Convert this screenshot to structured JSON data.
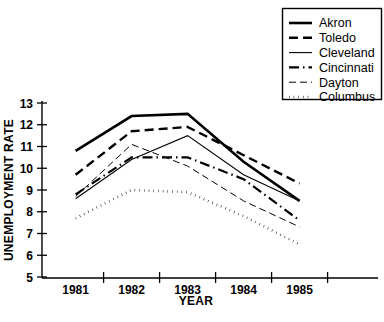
{
  "chart_data": {
    "type": "line",
    "title": "",
    "xlabel": "YEAR",
    "ylabel": "UNEMPLOYMENT RATE",
    "categories": [
      "1981",
      "1982",
      "1983",
      "1984",
      "1985"
    ],
    "x_tick_labels": [
      "1981",
      "1982",
      "1983",
      "1984",
      "1985"
    ],
    "y_tick_labels": [
      "5",
      "6",
      "7",
      "8",
      "9",
      "10",
      "11",
      "12",
      "13"
    ],
    "ylim": [
      5,
      13
    ],
    "y_ticks": [
      5,
      6,
      7,
      8,
      9,
      10,
      11,
      12,
      13
    ],
    "grid": false,
    "legend_position": "top-right",
    "series": [
      {
        "name": "Akron",
        "values": [
          10.8,
          12.4,
          12.5,
          10.3,
          8.5
        ],
        "style": "solid",
        "line_width": 2.6,
        "dash": "none"
      },
      {
        "name": "Toledo",
        "values": [
          9.7,
          11.7,
          11.9,
          10.6,
          9.3
        ],
        "style": "dashed",
        "line_width": 2.4,
        "dash": "9,5"
      },
      {
        "name": "Cleveland",
        "values": [
          8.6,
          10.4,
          11.5,
          9.7,
          8.5
        ],
        "style": "solid-thin",
        "line_width": 1.1,
        "dash": "none"
      },
      {
        "name": "Cincinnati",
        "values": [
          8.8,
          10.5,
          10.5,
          9.5,
          7.6
        ],
        "style": "dash-dot",
        "line_width": 2.2,
        "dash": "10,4,1.5,4"
      },
      {
        "name": "Dayton",
        "values": [
          8.7,
          11.1,
          10.1,
          8.5,
          7.3
        ],
        "style": "dashed-thin",
        "line_width": 1.0,
        "dash": "7,4"
      },
      {
        "name": "Columbus",
        "values": [
          7.7,
          9.0,
          8.9,
          7.8,
          6.5
        ],
        "style": "dotted",
        "line_width": 2.6,
        "dash": "0.5,4.2"
      }
    ],
    "colors": {
      "ink": "#000000",
      "background": "#ffffff"
    }
  },
  "legend": {
    "items": [
      {
        "label": "Akron"
      },
      {
        "label": "Toledo"
      },
      {
        "label": "Cleveland"
      },
      {
        "label": "Cincinnati"
      },
      {
        "label": "Dayton"
      },
      {
        "label": "Columbus"
      }
    ]
  },
  "axes": {
    "x_title": "YEAR",
    "y_title": "UNEMPLOYMENT RATE"
  }
}
